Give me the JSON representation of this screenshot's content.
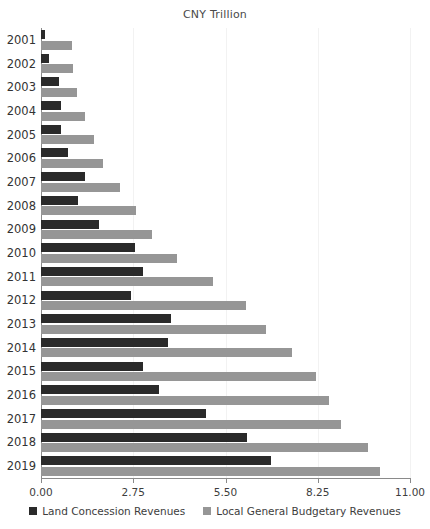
{
  "chart_data": {
    "type": "bar",
    "orientation": "horizontal",
    "title": "CNY Trillion",
    "xlabel": "",
    "ylabel": "",
    "xlim": [
      0.0,
      11.0
    ],
    "xticks": [
      "0.00",
      "2.75",
      "5.50",
      "8.25",
      "11.00"
    ],
    "xtick_values": [
      0.0,
      2.75,
      5.5,
      8.25,
      11.0
    ],
    "grid": true,
    "grid_axis": "x",
    "legend_position": "bottom",
    "categories": [
      "2001",
      "2002",
      "2003",
      "2004",
      "2005",
      "2006",
      "2007",
      "2008",
      "2009",
      "2010",
      "2011",
      "2012",
      "2013",
      "2014",
      "2015",
      "2016",
      "2017",
      "2018",
      "2019"
    ],
    "series": [
      {
        "name": "Land Concession Revenues",
        "color": "#2a2a2a",
        "values": [
          0.13,
          0.24,
          0.54,
          0.59,
          0.59,
          0.81,
          1.3,
          1.1,
          1.72,
          2.8,
          3.05,
          2.69,
          3.87,
          3.8,
          3.05,
          3.51,
          4.91,
          6.15,
          6.85
        ]
      },
      {
        "name": "Local General Budgetary Revenues",
        "color": "#969696",
        "values": [
          0.92,
          0.95,
          1.08,
          1.31,
          1.59,
          1.85,
          2.36,
          2.84,
          3.3,
          4.06,
          5.13,
          6.11,
          6.7,
          7.49,
          8.2,
          8.59,
          8.95,
          9.75,
          10.11
        ]
      }
    ]
  },
  "legend": {
    "items": [
      {
        "label": "Land Concession Revenues",
        "color": "#2a2a2a"
      },
      {
        "label": "Local General Budgetary Revenues",
        "color": "#969696"
      }
    ]
  }
}
